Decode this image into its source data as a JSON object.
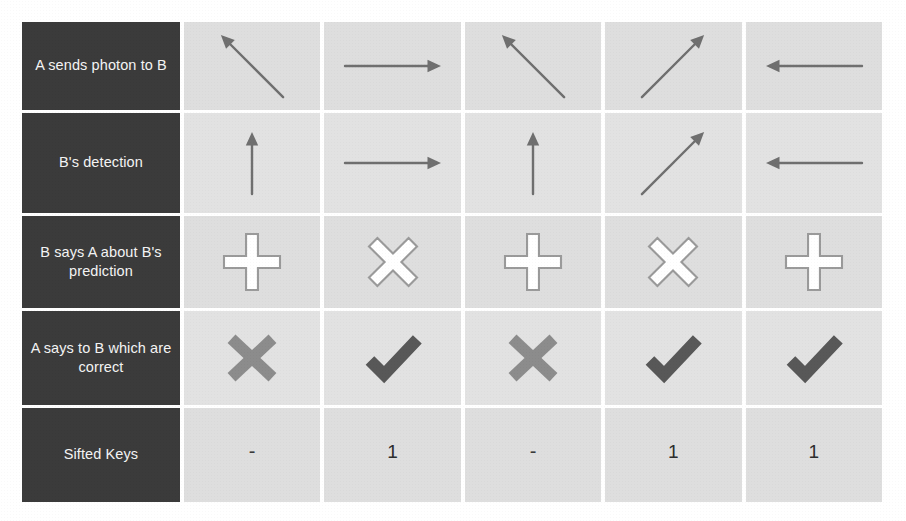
{
  "figure": {
    "colors": {
      "label_cell_bg": "#3b3b3b",
      "label_text": "#f4f4f4",
      "cell_bg": "#dedede",
      "arrow_gray": "#6f6f6f",
      "basis_outline_stroke": "#9a9a9a",
      "basis_fill": "#ffffff",
      "x_mark_gray": "#8c8c8c",
      "check_mark_gray": "#585858",
      "page_bg": "#ffffff"
    },
    "columns": 5
  },
  "rows": [
    {
      "id": "send",
      "label": "A sends photon to B",
      "kind": "arrow",
      "cells": [
        {
          "icon": "arrow-up-left-icon",
          "angle_deg": 135,
          "alt": "diagonal arrow up-left"
        },
        {
          "icon": "arrow-right-icon",
          "angle_deg": 0,
          "alt": "horizontal arrow right"
        },
        {
          "icon": "arrow-up-left-icon",
          "angle_deg": 135,
          "alt": "diagonal arrow up-left"
        },
        {
          "icon": "arrow-up-right-icon",
          "angle_deg": 45,
          "alt": "diagonal arrow up-right"
        },
        {
          "icon": "arrow-left-icon",
          "angle_deg": 180,
          "alt": "horizontal arrow left"
        }
      ]
    },
    {
      "id": "detect",
      "label": "B's detection",
      "kind": "arrow",
      "cells": [
        {
          "icon": "arrow-up-icon",
          "angle_deg": 90,
          "alt": "vertical arrow up"
        },
        {
          "icon": "arrow-right-icon",
          "angle_deg": 0,
          "alt": "horizontal arrow right"
        },
        {
          "icon": "arrow-up-icon",
          "angle_deg": 90,
          "alt": "vertical arrow up"
        },
        {
          "icon": "arrow-up-right-icon",
          "angle_deg": 45,
          "alt": "diagonal arrow up-right"
        },
        {
          "icon": "arrow-left-icon",
          "angle_deg": 180,
          "alt": "horizontal arrow left"
        }
      ]
    },
    {
      "id": "basis",
      "label": "B says A about B's prediction",
      "kind": "basis",
      "cells": [
        {
          "icon": "plus-basis-icon",
          "symbol": "+",
          "alt": "rectilinear basis plus"
        },
        {
          "icon": "cross-basis-icon",
          "symbol": "×",
          "alt": "diagonal basis cross"
        },
        {
          "icon": "plus-basis-icon",
          "symbol": "+",
          "alt": "rectilinear basis plus"
        },
        {
          "icon": "cross-basis-icon",
          "symbol": "×",
          "alt": "diagonal basis cross"
        },
        {
          "icon": "plus-basis-icon",
          "symbol": "+",
          "alt": "rectilinear basis plus"
        }
      ]
    },
    {
      "id": "verdict",
      "label": "A says to B which are correct",
      "kind": "verdict",
      "cells": [
        {
          "icon": "x-mark-icon",
          "state": "incorrect",
          "alt": "cross mark incorrect"
        },
        {
          "icon": "check-mark-icon",
          "state": "correct",
          "alt": "check mark correct"
        },
        {
          "icon": "x-mark-icon",
          "state": "incorrect",
          "alt": "cross mark incorrect"
        },
        {
          "icon": "check-mark-icon",
          "state": "correct",
          "alt": "check mark correct"
        },
        {
          "icon": "check-mark-icon",
          "state": "correct",
          "alt": "check mark correct"
        }
      ]
    },
    {
      "id": "sifted",
      "label": "Sifted Keys",
      "kind": "text",
      "cells": [
        {
          "value": "-"
        },
        {
          "value": "1"
        },
        {
          "value": "-"
        },
        {
          "value": "1"
        },
        {
          "value": "1"
        }
      ]
    }
  ]
}
